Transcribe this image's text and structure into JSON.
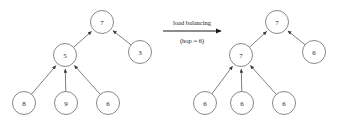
{
  "figure": {
    "background_color": "#ffffff",
    "node_stroke_color": "#7a7a7a",
    "edge_color": "#6f6f6f",
    "text_color": "#1a1a1a"
  },
  "transform": {
    "label_top": "load balancing",
    "label_bottom": "(hop = 6)",
    "arrow_direction": "right"
  },
  "left_tree": {
    "name": "before-load-balancing",
    "nodes": [
      {
        "id": "L0",
        "label": "7",
        "cx": 102,
        "cy": 22,
        "r": 11.5
      },
      {
        "id": "L1",
        "label": "5",
        "cx": 65,
        "cy": 55,
        "r": 11.5
      },
      {
        "id": "L2",
        "label": "3",
        "cx": 140,
        "cy": 52,
        "r": 11.5
      },
      {
        "id": "L3",
        "label": "8",
        "cx": 24,
        "cy": 103,
        "r": 11.5
      },
      {
        "id": "L4",
        "label": "9",
        "cx": 66,
        "cy": 103,
        "r": 11.5
      },
      {
        "id": "L5",
        "label": "6",
        "cx": 108,
        "cy": 103,
        "r": 11.5
      }
    ],
    "edges": [
      {
        "from": "L1",
        "to": "L0"
      },
      {
        "from": "L2",
        "to": "L0"
      },
      {
        "from": "L3",
        "to": "L1"
      },
      {
        "from": "L4",
        "to": "L1"
      },
      {
        "from": "L5",
        "to": "L1"
      }
    ]
  },
  "right_tree": {
    "name": "after-load-balancing",
    "nodes": [
      {
        "id": "R0",
        "label": "7",
        "cx": 277,
        "cy": 22,
        "r": 11.5
      },
      {
        "id": "R1",
        "label": "7",
        "cx": 241,
        "cy": 55,
        "r": 11.5
      },
      {
        "id": "R2",
        "label": "6",
        "cx": 314,
        "cy": 52,
        "r": 11.5
      },
      {
        "id": "R3",
        "label": "6",
        "cx": 205,
        "cy": 103,
        "r": 11.5
      },
      {
        "id": "R4",
        "label": "6",
        "cx": 242,
        "cy": 103,
        "r": 11.5
      },
      {
        "id": "R5",
        "label": "6",
        "cx": 284,
        "cy": 103,
        "r": 11.5
      }
    ],
    "edges": [
      {
        "from": "R1",
        "to": "R0"
      },
      {
        "from": "R2",
        "to": "R0"
      },
      {
        "from": "R3",
        "to": "R1"
      },
      {
        "from": "R4",
        "to": "R1"
      },
      {
        "from": "R5",
        "to": "R1"
      }
    ]
  }
}
